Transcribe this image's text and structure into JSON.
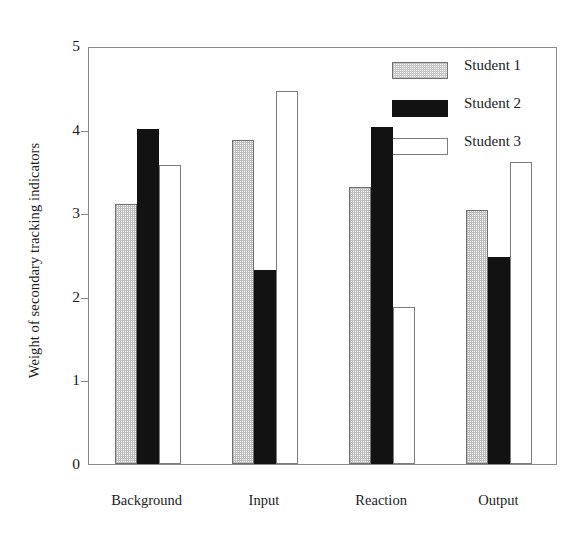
{
  "chart_data": {
    "type": "bar",
    "title": "",
    "xlabel": "",
    "ylabel": "Weight of secondary tracking indicators",
    "categories": [
      "Background",
      "Input",
      "Reaction",
      "Output"
    ],
    "series": [
      {
        "name": "Student 1",
        "values": [
          3.11,
          3.88,
          3.31,
          3.04
        ],
        "fill": "stippled-gray",
        "color": "#bdbdbd"
      },
      {
        "name": "Student 2",
        "values": [
          4.01,
          2.32,
          4.03,
          2.48
        ],
        "fill": "solid-black",
        "color": "#121212"
      },
      {
        "name": "Student 3",
        "values": [
          3.58,
          4.46,
          1.88,
          3.61
        ],
        "fill": "white-outlined",
        "color": "#ffffff"
      }
    ],
    "ylim": [
      0,
      5
    ],
    "yticks": [
      0,
      1,
      2,
      3,
      4,
      5
    ],
    "ytick_labels": [
      "0",
      "1",
      "2",
      "3",
      "4",
      "5"
    ],
    "grid": false,
    "legend_position": "top-right",
    "frame": true
  },
  "axis": {
    "y_title": "Weight of secondary tracking indicators",
    "y_tick_labels": [
      "5",
      "4",
      "3",
      "2",
      "1",
      "0"
    ],
    "x_tick_labels": [
      "Background",
      "Input",
      "Reaction",
      "Output"
    ]
  },
  "legend": {
    "entries": [
      {
        "label": "Student 1"
      },
      {
        "label": "Student 2"
      },
      {
        "label": "Student 3"
      }
    ]
  }
}
